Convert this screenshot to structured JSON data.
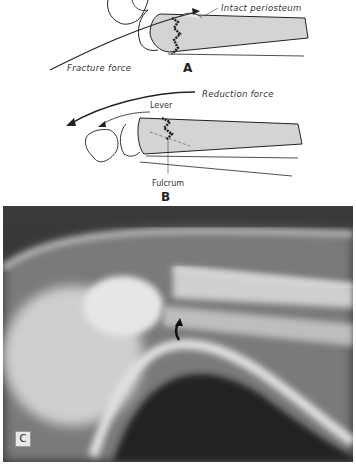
{
  "panel_a": {
    "label": "A",
    "annotations": {
      "intact_periosteum": "Intact periosteum",
      "fracture_force": "Fracture force"
    }
  },
  "panel_b": {
    "label": "B",
    "annotations": {
      "reduction_force": "Reduction force",
      "lever": "Lever",
      "fulcrum": "Fulcrum"
    }
  },
  "panel_c": {
    "label": "C",
    "description": "Lateral radiograph of distal forearm fracture with curved arrow marking fracture site"
  },
  "colors": {
    "bone_fill": "#d4d4d4",
    "ink": "#222222",
    "xray_dark": "#2a2a2a",
    "xray_bright": "#e6e6e6"
  }
}
